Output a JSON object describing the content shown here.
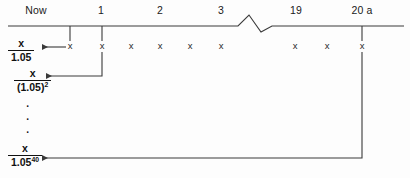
{
  "diagram": {
    "background_color": "#fdfdfd",
    "line_color": "#3a3a3a",
    "text_color": "#111111",
    "axis": {
      "y": 26,
      "x_start": 8,
      "x_end": 404,
      "break_symbol": "zigzag",
      "break_x_start": 238,
      "break_x_end": 272
    },
    "period_labels": [
      {
        "text": "Now",
        "x": 36,
        "y": 4
      },
      {
        "text": "1",
        "x": 101,
        "y": 4
      },
      {
        "text": "2",
        "x": 160,
        "y": 4
      },
      {
        "text": "3",
        "x": 221,
        "y": 4
      },
      {
        "text": "19",
        "x": 296,
        "y": 4
      },
      {
        "text": "20 a",
        "x": 362,
        "y": 4
      }
    ],
    "cash_flow_marks": [
      {
        "symbol": "x",
        "x": 70,
        "y": 46
      },
      {
        "symbol": "x",
        "x": 102,
        "y": 46
      },
      {
        "symbol": "x",
        "x": 131,
        "y": 46
      },
      {
        "symbol": "x",
        "x": 160,
        "y": 46
      },
      {
        "symbol": "x",
        "x": 190,
        "y": 46
      },
      {
        "symbol": "x",
        "x": 221,
        "y": 46
      },
      {
        "symbol": "x",
        "x": 295,
        "y": 46
      },
      {
        "symbol": "x",
        "x": 327,
        "y": 46
      },
      {
        "symbol": "x",
        "x": 362,
        "y": 46
      }
    ],
    "tick_drops": [
      {
        "x": 70,
        "y_from": 26,
        "y_to": 41
      },
      {
        "x": 102,
        "y_from": 26,
        "y_to": 41
      },
      {
        "x": 362,
        "y_from": 26,
        "y_to": 41
      }
    ],
    "discount_terms": [
      {
        "name": "one-period-discount",
        "numerator": "x",
        "denominator": "1.05",
        "exponent": "",
        "x": 8,
        "y": 38
      },
      {
        "name": "two-period-discount",
        "numerator": "x",
        "denominator": "(1.05)",
        "exponent": "2",
        "x": 14,
        "y": 68
      },
      {
        "name": "forty-period-discount",
        "numerator": "x",
        "denominator": "1.05",
        "exponent": "40",
        "x": 8,
        "y": 143
      }
    ],
    "ellipsis_dots": {
      "symbol": "·",
      "count": 3,
      "x": 28,
      "y": 100
    },
    "discount_arrows": [
      {
        "name": "arrow-period-1",
        "from_x": 66,
        "from_y": 47,
        "to_x": 40,
        "to_y": 47,
        "path": "straight"
      },
      {
        "name": "arrow-period-2",
        "from_x": 102,
        "from_y": 52,
        "corner_y": 76,
        "to_x": 44,
        "to_y": 76,
        "path": "elbow"
      },
      {
        "name": "arrow-period-40",
        "from_x": 362,
        "from_y": 52,
        "corner_y": 158,
        "to_x": 40,
        "to_y": 158,
        "path": "elbow"
      }
    ]
  }
}
